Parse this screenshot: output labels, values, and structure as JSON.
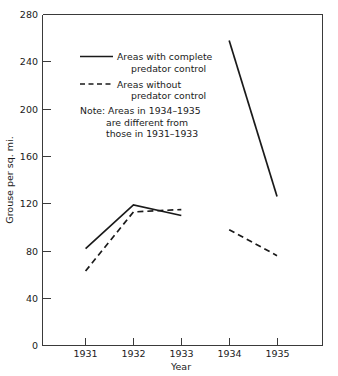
{
  "chart_data": {
    "type": "line",
    "title": "",
    "xlabel": "Year",
    "ylabel": "Grouse per sq. mi.",
    "x": [
      1931,
      1932,
      1933,
      1934,
      1935
    ],
    "xtick_labels": [
      "1931",
      "1932",
      "1933",
      "1934",
      "1935"
    ],
    "ytick_labels": [
      "0",
      "40",
      "80",
      "120",
      "160",
      "200",
      "240",
      "280"
    ],
    "ytick_values": [
      0,
      40,
      80,
      120,
      160,
      200,
      240,
      280
    ],
    "ylim": [
      0,
      280
    ],
    "xlim": [
      1930.1,
      1935.95
    ],
    "grid": false,
    "legend_position": "upper-left-inside",
    "series": [
      {
        "name": "Areas with complete predator control",
        "style": "solid",
        "color": "#1a1a1a",
        "segments": [
          {
            "x": [
              1931,
              1932,
              1933
            ],
            "values": [
              82,
              119,
              110
            ]
          },
          {
            "x": [
              1934,
              1935
            ],
            "values": [
              258,
              126
            ]
          }
        ]
      },
      {
        "name": "Areas without predator control",
        "style": "dashed",
        "color": "#1a1a1a",
        "segments": [
          {
            "x": [
              1931,
              1932,
              1933
            ],
            "values": [
              63,
              113,
              115
            ]
          },
          {
            "x": [
              1934,
              1935
            ],
            "values": [
              98,
              76
            ]
          }
        ]
      }
    ],
    "annotations": [
      "Note: Areas in 1934–1935",
      "are different from",
      "those in 1931–1933"
    ]
  },
  "legend": {
    "entries": [
      {
        "line1": "Areas with complete",
        "line2": "predator control",
        "style": "solid"
      },
      {
        "line1": "Areas without",
        "line2": "predator control",
        "style": "dashed"
      }
    ],
    "note_line1": "Note: Areas in 1934–1935",
    "note_line2": "are different from",
    "note_line3": "those in 1931–1933"
  },
  "axes": {
    "y_title": "Grouse per sq. mi.",
    "x_title": "Year",
    "y_ticks": [
      "280",
      "240",
      "200",
      "160",
      "120",
      "80",
      "40",
      "0"
    ],
    "x_ticks": [
      "1931",
      "1932",
      "1933",
      "1934",
      "1935"
    ]
  },
  "colors": {
    "line": "#1a1a1a",
    "axis": "#3a3a3a",
    "background": "#ffffff",
    "text": "#1a1a1a"
  }
}
